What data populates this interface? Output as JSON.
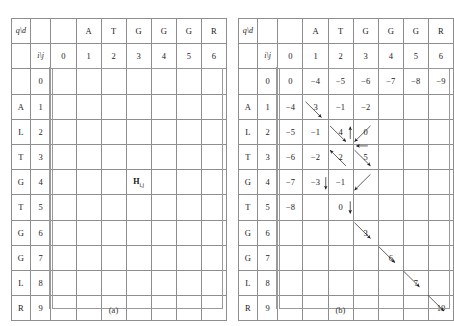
{
  "figure": {
    "panels": [
      {
        "id": "a",
        "caption": "(a)",
        "corner_label": "q\\d",
        "index_label": "i\\j",
        "column_letters": [
          "",
          "A",
          "T",
          "G",
          "G",
          "G",
          "R"
        ],
        "column_indices": [
          "0",
          "1",
          "2",
          "3",
          "4",
          "5",
          "6"
        ],
        "row_letters": [
          "",
          "A",
          "L",
          "T",
          "G",
          "T",
          "G",
          "G",
          "L",
          "R"
        ],
        "row_indices": [
          "0",
          "1",
          "2",
          "3",
          "4",
          "5",
          "6",
          "7",
          "8",
          "9"
        ],
        "cell_label": "H",
        "cell_label_sub": "i,j",
        "cell_label_row": 4,
        "cell_label_col": 3,
        "shaded_cells": [
          {
            "row": 0,
            "col": 3
          },
          {
            "row": 1,
            "col": 3
          },
          {
            "row": 2,
            "col": 3
          },
          {
            "row": 3,
            "col": 3
          },
          {
            "row": 3,
            "col": 2
          },
          {
            "row": 4,
            "col": 0
          },
          {
            "row": 4,
            "col": 1
          },
          {
            "row": 4,
            "col": 2
          }
        ]
      },
      {
        "id": "b",
        "caption": "(b)",
        "corner_label": "q\\d",
        "index_label": "i\\j",
        "column_letters": [
          "",
          "A",
          "T",
          "G",
          "G",
          "G",
          "R"
        ],
        "column_indices": [
          "0",
          "1",
          "2",
          "3",
          "4",
          "5",
          "6"
        ],
        "row_letters": [
          "",
          "A",
          "L",
          "T",
          "G",
          "T",
          "G",
          "G",
          "L",
          "R"
        ],
        "row_indices": [
          "0",
          "1",
          "2",
          "3",
          "4",
          "5",
          "6",
          "7",
          "8",
          "9"
        ],
        "values": [
          [
            "0",
            "−4",
            "−5",
            "−6",
            "−7",
            "−8",
            "−9"
          ],
          [
            "−4",
            "3",
            "−1",
            "−2",
            "",
            "",
            ""
          ],
          [
            "−5",
            "−1",
            "4",
            "0",
            "",
            "",
            ""
          ],
          [
            "−6",
            "−2",
            "2",
            "5",
            "",
            "",
            ""
          ],
          [
            "−7",
            "−3",
            "−1",
            "",
            "",
            "",
            ""
          ],
          [
            "−8",
            "",
            "0",
            "",
            "",
            "",
            ""
          ],
          [
            "",
            "",
            "",
            "3",
            "",
            "",
            ""
          ],
          [
            "",
            "",
            "",
            "",
            "6",
            "",
            ""
          ],
          [
            "",
            "",
            "",
            "",
            "",
            "7",
            ""
          ],
          [
            "",
            "",
            "",
            "",
            "",
            "",
            "10"
          ]
        ]
      }
    ]
  },
  "chart_data": {
    "type": "table",
    "subcharts": [
      {
        "name": "(a) dependency / traceback region",
        "description": "Empty DP grid with shaded cells marking the region Hi,j depends on",
        "query_sequence": [
          "A",
          "L",
          "T",
          "G",
          "T",
          "G",
          "G",
          "L",
          "R"
        ],
        "database_sequence": [
          "A",
          "T",
          "G",
          "G",
          "G",
          "R"
        ],
        "row_indices": [
          0,
          1,
          2,
          3,
          4,
          5,
          6,
          7,
          8,
          9
        ],
        "column_indices": [
          0,
          1,
          2,
          3,
          4,
          5,
          6
        ],
        "shaded_cells": [
          [
            0,
            3
          ],
          [
            1,
            3
          ],
          [
            2,
            3
          ],
          [
            3,
            3
          ],
          [
            3,
            2
          ],
          [
            4,
            0
          ],
          [
            4,
            1
          ],
          [
            4,
            2
          ]
        ],
        "annotated_cell": {
          "row": 4,
          "col": 3,
          "label": "Hi,j"
        }
      },
      {
        "name": "(b) filled score matrix with traceback arrows",
        "query_sequence": [
          "A",
          "L",
          "T",
          "G",
          "T",
          "G",
          "G",
          "L",
          "R"
        ],
        "database_sequence": [
          "A",
          "T",
          "G",
          "G",
          "G",
          "R"
        ],
        "matrix": [
          [
            0,
            -4,
            -5,
            -6,
            -7,
            -8,
            -9
          ],
          [
            -4,
            3,
            -1,
            -2,
            null,
            null,
            null
          ],
          [
            -5,
            -1,
            4,
            0,
            null,
            null,
            null
          ],
          [
            -6,
            -2,
            2,
            5,
            null,
            null,
            null
          ],
          [
            -7,
            -3,
            -1,
            null,
            null,
            null,
            null
          ],
          [
            -8,
            null,
            0,
            null,
            null,
            null,
            null
          ],
          [
            null,
            null,
            null,
            3,
            null,
            null,
            null
          ],
          [
            null,
            null,
            null,
            null,
            6,
            null,
            null
          ],
          [
            null,
            null,
            null,
            null,
            null,
            7,
            null
          ],
          [
            null,
            null,
            null,
            null,
            null,
            null,
            10
          ]
        ],
        "traceback_path_values": [
          0,
          3,
          4,
          5,
          0,
          3,
          6,
          7,
          10
        ]
      }
    ]
  }
}
